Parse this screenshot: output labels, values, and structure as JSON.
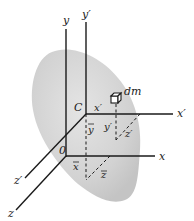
{
  "diagram": {
    "colors": {
      "body_fill": "#d4d4d4",
      "axis": "#1a1a1a",
      "background": "#ffffff"
    },
    "labels": {
      "y": "y",
      "y_prime": "y′",
      "x": "x",
      "x_prime": "x′",
      "z": "z",
      "z_prime": "z′",
      "dm": "dm",
      "C": "C",
      "O": "0",
      "x_prime_inner": "x′",
      "y_prime_inner": "y′",
      "z_prime_inner": "z′",
      "x_bar": "x",
      "y_bar": "y",
      "z_bar": "z"
    }
  }
}
